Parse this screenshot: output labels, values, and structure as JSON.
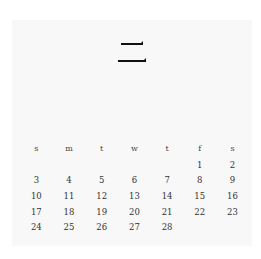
{
  "calendar": {
    "month_glyph": "二",
    "weekdays": [
      "s",
      "m",
      "t",
      "w",
      "t",
      "f",
      "s"
    ],
    "weeks": [
      [
        "",
        "",
        "",
        "",
        "",
        "1",
        "2"
      ],
      [
        "3",
        "4",
        "5",
        "6",
        "7",
        "8",
        "9"
      ],
      [
        "10",
        "11",
        "12",
        "13",
        "14",
        "15",
        "16"
      ],
      [
        "17",
        "18",
        "19",
        "20",
        "21",
        "22",
        "23"
      ],
      [
        "24",
        "25",
        "26",
        "27",
        "28",
        "",
        ""
      ]
    ]
  },
  "colors": {
    "page_background": "#f8f8f8",
    "ink": "#111111",
    "text": "#333333"
  }
}
